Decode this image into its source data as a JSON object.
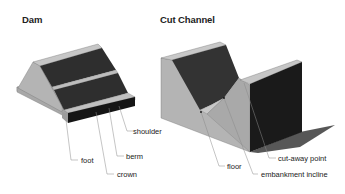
{
  "diagrams": [
    {
      "title": "Dam",
      "labels": {
        "shoulder": "shoulder",
        "berm": "berm",
        "foot": "foot",
        "crown": "crown"
      }
    },
    {
      "title": "Cut Channel",
      "labels": {
        "cut_away_point": "cut-away point",
        "floor": "floor",
        "embankment_incline": "embankment incline"
      }
    }
  ],
  "colors": {
    "light_face": "#b4b4b4",
    "mid_face": "#9a9a9a",
    "dark_face": "#2c2c2c",
    "shadow": "#3a3a3a",
    "leader": "#888888"
  }
}
